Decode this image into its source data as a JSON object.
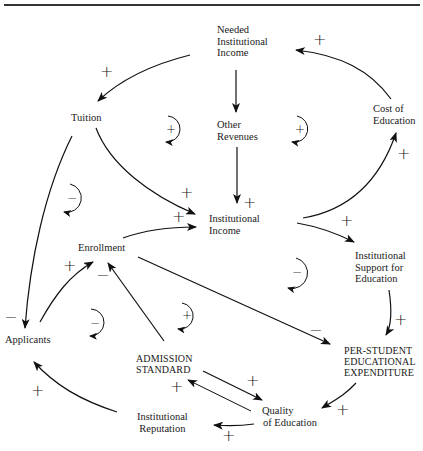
{
  "diagram": {
    "nodes": {
      "needed_income": [
        "Needed",
        "Institutional",
        "Income"
      ],
      "tuition": [
        "Tuition"
      ],
      "other_revenues": [
        "Other",
        "Revenues"
      ],
      "cost_of_education": [
        "Cost of",
        "Education"
      ],
      "institutional_income": [
        "Institutional",
        "Income"
      ],
      "enrollment": [
        "Enrollment"
      ],
      "institutional_support": [
        "Institutional",
        "Support for",
        "Education"
      ],
      "applicants": [
        "Applicants"
      ],
      "admission_standard": [
        "ADMISSION",
        "STANDARD"
      ],
      "per_student_expenditure": [
        "PER-STUDENT",
        "EDUCATIONAL",
        "EXPENDITURE"
      ],
      "quality_of_education": [
        "Quality",
        "of Education"
      ],
      "institutional_reputation": [
        "Institutional",
        "Reputation"
      ]
    },
    "links": [
      {
        "from": "Needed Institutional Income",
        "to": "Tuition",
        "polarity": "+"
      },
      {
        "from": "Needed Institutional Income",
        "to": "Other Revenues",
        "polarity": ""
      },
      {
        "from": "Cost of Education",
        "to": "Needed Institutional Income",
        "polarity": "+"
      },
      {
        "from": "Other Revenues",
        "to": "Institutional Income",
        "polarity": "+"
      },
      {
        "from": "Tuition",
        "to": "Institutional Income",
        "polarity": "+"
      },
      {
        "from": "Tuition",
        "to": "Applicants",
        "polarity": "-"
      },
      {
        "from": "Enrollment",
        "to": "Institutional Income",
        "polarity": "+"
      },
      {
        "from": "Institutional Income",
        "to": "Cost of Education",
        "polarity": "+"
      },
      {
        "from": "Institutional Income",
        "to": "Institutional Support for Education",
        "polarity": "+"
      },
      {
        "from": "Institutional Support for Education",
        "to": "PER-STUDENT EDUCATIONAL EXPENDITURE",
        "polarity": "+"
      },
      {
        "from": "Enrollment",
        "to": "PER-STUDENT EDUCATIONAL EXPENDITURE",
        "polarity": "-"
      },
      {
        "from": "Applicants",
        "to": "Enrollment",
        "polarity": "+"
      },
      {
        "from": "ADMISSION STANDARD",
        "to": "Enrollment",
        "polarity": "-"
      },
      {
        "from": "PER-STUDENT EDUCATIONAL EXPENDITURE",
        "to": "Quality of Education",
        "polarity": "+"
      },
      {
        "from": "ADMISSION STANDARD",
        "to": "Quality of Education",
        "polarity": "+"
      },
      {
        "from": "Quality of Education",
        "to": "ADMISSION STANDARD",
        "polarity": "+"
      },
      {
        "from": "Quality of Education",
        "to": "Institutional Reputation",
        "polarity": "+"
      },
      {
        "from": "Institutional Reputation",
        "to": "Applicants",
        "polarity": "+"
      }
    ],
    "loops": [
      {
        "position": "left of Other Revenues",
        "polarity": "+"
      },
      {
        "position": "right of Other Revenues",
        "polarity": "+"
      },
      {
        "position": "below Tuition",
        "polarity": "-"
      },
      {
        "position": "right of Institutional Income",
        "polarity": "-"
      },
      {
        "position": "between Applicants and Admission Standard",
        "polarity": "-"
      },
      {
        "position": "above Admission Standard",
        "polarity": "+"
      }
    ],
    "signs": {
      "plus": "+",
      "minus": "−"
    }
  }
}
